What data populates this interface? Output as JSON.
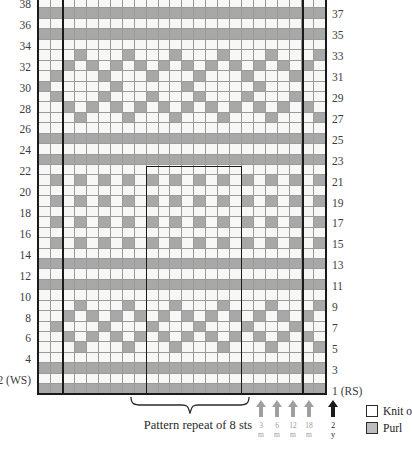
{
  "chart_data": {
    "type": "heatmap",
    "xlabel": "Stitches",
    "ylabel": "Rows",
    "columns": 24,
    "rows": 38,
    "legend_position": "bottom-right",
    "grid": true,
    "cell_codes": {
      "k": "Knit",
      "p": "Purl"
    },
    "row_numbers_left": [
      "38",
      "36",
      "34",
      "32",
      "30",
      "28",
      "26",
      "24",
      "22",
      "20",
      "18",
      "16",
      "14",
      "12",
      "10",
      "8",
      "6",
      "4",
      "2 (WS)"
    ],
    "row_numbers_right": [
      "37",
      "35",
      "33",
      "31",
      "29",
      "27",
      "25",
      "23",
      "21",
      "19",
      "17",
      "15",
      "13",
      "11",
      "9",
      "7",
      "5",
      "3",
      "1 (RS)"
    ],
    "pattern_repeat_stitches": 8,
    "repeat_separator_columns": [
      2,
      22
    ],
    "rows_data": [
      "pppppppppppppppppppppppp",
      "kkkkkkkkkkkkkkkkkkkkkkkk",
      "pppppppppppppppppppppppp",
      "kkkkkkkkkkkkkkkkkkkkkkkk",
      "kkkpkkkpkkkpkkkpkkkpkkkp",
      "kkpkpkpkpkpkpkpkpkpkpkpk",
      "kpkkkpkkkpkkkpkkkpkkkpkk",
      "kkpkpkpkpkpkpkpkpkpkpkpk",
      "kkkpkkkpkkkpkkkpkkkpkkkp",
      "kkkkkkkkkkkkkkkkkkkkkkkk",
      "pppppppppppppppppppppppp",
      "kkkkkkkkkkkkkkkkkkkkkkkk",
      "pppppppppppppppppppppppp",
      "kkkkkkkkkkkkkkkkkkkkkkkk",
      "kpkpkpkpkpkpkpkpkpkpkpkp",
      "kkkkkkkkkkkkkkkkkkkkkkkk",
      "kpkpkpkpkpkpkpkpkpkpkpkp",
      "kkkkkkkkkkkkkkkkkkkkkkkk",
      "kpkpkpkpkpkpkpkpkpkpkpkp",
      "kkkkkkkkkkkkkkkkkkkkkkkk",
      "kpkpkpkpkpkpkpkpkpkpkpkp",
      "kkkkkkkkkkkkkkkkkkkkkkkk",
      "pppppppppppppppppppppppp",
      "kkkkkkkkkkkkkkkkkkkkkkkk",
      "pppppppppppppppppppppppp",
      "kkkkkkkkkkkkkkkkkkkkkkkk",
      "kkkpkkkpkkkpkkkpkkkpkkkp",
      "kkpkpkpkpkpkpkpkpkpkpkpk",
      "kpkkkpkkkpkkkpkkkpkkkpkk",
      "pkkkkkpkkkkkpkkkkkpkkkkk",
      "kpkkkpkkkpkkkpkkkpkkkpkk",
      "kkpkpkpkpkpkpkpkpkpkpkpk",
      "kkkpkkkpkkkpkkkpkkkpkkkp",
      "kkkkkkkkkkkkkkkkkkkkkkkk",
      "pppppppppppppppppppppppp",
      "kkkkkkkkkkkkkkkkkkkkkkkk",
      "pppppppppppppppppppppppp",
      "kkkkkkkkkkkkkkkkkkkkkkkk"
    ]
  },
  "annotations": {
    "repeat_label": "Pattern repeat of 8 sts",
    "size_arrows": [
      {
        "name": "size-3m",
        "line1": "3",
        "line2": "m",
        "emphasis": "light"
      },
      {
        "name": "size-6m",
        "line1": "6",
        "line2": "m",
        "emphasis": "light"
      },
      {
        "name": "size-12m",
        "line1": "12",
        "line2": "m",
        "emphasis": "light"
      },
      {
        "name": "size-18m",
        "line1": "18",
        "line2": "m",
        "emphasis": "light"
      },
      {
        "name": "size-2y",
        "line1": "2",
        "line2": "y",
        "emphasis": "dark"
      }
    ]
  },
  "legend": {
    "items": [
      {
        "label": "Knit o",
        "swatch": "knit"
      },
      {
        "label": "Purl",
        "swatch": "purl"
      }
    ]
  },
  "colors": {
    "knit": "#f7f7f5",
    "purl": "#a8a8a8",
    "grid_line": "#9b9b9b",
    "heavy_line": "#1a1a1a",
    "text": "#3b3b3b"
  }
}
